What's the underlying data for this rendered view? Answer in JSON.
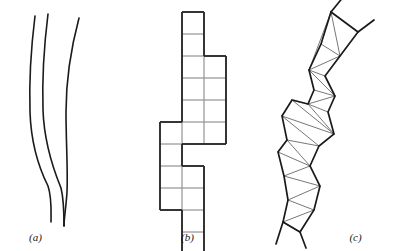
{
  "figure": {
    "background_color": "#ffffff",
    "stroke_color": "#1a1a1a",
    "thin_stroke_color": "#3c3c3c",
    "panel_count": 3
  },
  "panels": [
    {
      "id": "a",
      "label": "(a)",
      "name": "smooth-curves-panel",
      "description": "three smooth nearly parallel vertical curves"
    },
    {
      "id": "b",
      "label": "(b)",
      "name": "polyomino-panel",
      "description": "vertical polyomino staircase of unit squares"
    },
    {
      "id": "c",
      "label": "(c)",
      "name": "triangulated-strip-panel",
      "description": "triangulated zigzag polygonal strip"
    }
  ],
  "chart_data": {
    "type": "line",
    "title": "",
    "xlabel": "",
    "ylabel": "",
    "panel_a_curves": [
      {
        "name": "curve-left",
        "points": [
          [
            35,
            16
          ],
          [
            33,
            40
          ],
          [
            31,
            66
          ],
          [
            30,
            92
          ],
          [
            30,
            118
          ],
          [
            32,
            142
          ],
          [
            36,
            162
          ],
          [
            42,
            178
          ],
          [
            47,
            190
          ],
          [
            50,
            200
          ],
          [
            51,
            212
          ],
          [
            51,
            222
          ]
        ]
      },
      {
        "name": "curve-middle",
        "points": [
          [
            48,
            14
          ],
          [
            46,
            38
          ],
          [
            44,
            64
          ],
          [
            43,
            90
          ],
          [
            43,
            116
          ],
          [
            45,
            140
          ],
          [
            49,
            160
          ],
          [
            55,
            176
          ],
          [
            60,
            190
          ],
          [
            63,
            202
          ],
          [
            64,
            214
          ],
          [
            64,
            226
          ]
        ]
      },
      {
        "name": "curve-right",
        "points": [
          [
            79,
            18
          ],
          [
            74,
            40
          ],
          [
            70,
            64
          ],
          [
            67,
            90
          ],
          [
            66,
            116
          ],
          [
            66,
            140
          ],
          [
            67,
            160
          ],
          [
            68,
            176
          ],
          [
            67,
            192
          ],
          [
            65,
            206
          ],
          [
            64,
            216
          ],
          [
            64,
            226
          ]
        ]
      }
    ],
    "panel_b_cells": [
      [
        1,
        0
      ],
      [
        1,
        1
      ],
      [
        1,
        2
      ],
      [
        2,
        2
      ],
      [
        1,
        3
      ],
      [
        2,
        3
      ],
      [
        1,
        4
      ],
      [
        2,
        4
      ],
      [
        0,
        5
      ],
      [
        1,
        5
      ],
      [
        2,
        5
      ],
      [
        0,
        6
      ],
      [
        0,
        7
      ],
      [
        1,
        7
      ],
      [
        0,
        8
      ],
      [
        1,
        8
      ],
      [
        1,
        9
      ],
      [
        1,
        10
      ]
    ],
    "panel_b_cell_size": 22,
    "panel_b_origin": [
      29,
      12
    ],
    "panel_b_cols": 3,
    "panel_b_rows": 11,
    "panel_c_polygon": [
      [
        69,
        12
      ],
      [
        59,
        44
      ],
      [
        47,
        70
      ],
      [
        52,
        90
      ],
      [
        46,
        104
      ],
      [
        30,
        100
      ],
      [
        20,
        116
      ],
      [
        25,
        140
      ],
      [
        16,
        152
      ],
      [
        22,
        176
      ],
      [
        26,
        200
      ],
      [
        21,
        222
      ],
      [
        38,
        232
      ],
      [
        52,
        210
      ],
      [
        58,
        186
      ],
      [
        48,
        166
      ],
      [
        57,
        146
      ],
      [
        72,
        134
      ],
      [
        66,
        112
      ],
      [
        73,
        96
      ],
      [
        63,
        76
      ],
      [
        78,
        56
      ],
      [
        96,
        32
      ]
    ],
    "panel_c_diagonals": [
      [
        [
          69,
          12
        ],
        [
          47,
          70
        ]
      ],
      [
        [
          69,
          12
        ],
        [
          78,
          56
        ]
      ],
      [
        [
          59,
          44
        ],
        [
          78,
          56
        ]
      ],
      [
        [
          47,
          70
        ],
        [
          78,
          56
        ]
      ],
      [
        [
          47,
          70
        ],
        [
          63,
          76
        ]
      ],
      [
        [
          47,
          70
        ],
        [
          73,
          96
        ]
      ],
      [
        [
          52,
          90
        ],
        [
          73,
          96
        ]
      ],
      [
        [
          46,
          104
        ],
        [
          73,
          96
        ]
      ],
      [
        [
          46,
          104
        ],
        [
          66,
          112
        ]
      ],
      [
        [
          46,
          104
        ],
        [
          72,
          134
        ]
      ],
      [
        [
          30,
          100
        ],
        [
          72,
          134
        ]
      ],
      [
        [
          20,
          116
        ],
        [
          72,
          134
        ]
      ],
      [
        [
          20,
          116
        ],
        [
          57,
          146
        ]
      ],
      [
        [
          25,
          140
        ],
        [
          57,
          146
        ]
      ],
      [
        [
          25,
          140
        ],
        [
          48,
          166
        ]
      ],
      [
        [
          16,
          152
        ],
        [
          48,
          166
        ]
      ],
      [
        [
          22,
          176
        ],
        [
          48,
          166
        ]
      ],
      [
        [
          22,
          176
        ],
        [
          58,
          186
        ]
      ],
      [
        [
          26,
          200
        ],
        [
          58,
          186
        ]
      ],
      [
        [
          26,
          200
        ],
        [
          52,
          210
        ]
      ],
      [
        [
          21,
          222
        ],
        [
          52,
          210
        ]
      ],
      [
        [
          21,
          222
        ],
        [
          38,
          232
        ]
      ]
    ]
  }
}
